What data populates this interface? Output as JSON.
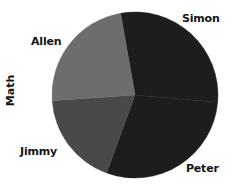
{
  "chart_data": {
    "type": "pie",
    "title": "Math",
    "xlabel": "",
    "ylabel": "",
    "legend_position": "none",
    "grid": false,
    "labels": [
      "Simon",
      "Peter",
      "Jimmy",
      "Allen"
    ],
    "categories": [
      "Simon",
      "Peter",
      "Jimmy",
      "Allen"
    ],
    "values": [
      29,
      33,
      18,
      20
    ],
    "units": "percent",
    "start_angle_deg": -10,
    "direction": "clockwise",
    "series": [
      {
        "name": "Math",
        "values": [
          29,
          33,
          18,
          20
        ]
      }
    ],
    "slices": [
      {
        "label": "Simon",
        "value": 29,
        "color": "#1d1d1d",
        "start_deg": -10,
        "end_deg": 95,
        "label_position": "top-right"
      },
      {
        "label": "Peter",
        "value": 33,
        "color": "#1d1d1d",
        "start_deg": 95,
        "end_deg": 200,
        "label_position": "bottom-right"
      },
      {
        "label": "Jimmy",
        "value": 18,
        "color": "#494949",
        "start_deg": 200,
        "end_deg": 266,
        "label_position": "bottom-left"
      },
      {
        "label": "Allen",
        "value": 20,
        "color": "#6d6d6d",
        "start_deg": 266,
        "end_deg": 350,
        "label_position": "top-left"
      }
    ],
    "geometry": {
      "center_x": 135,
      "center_y": 95,
      "radius": 83
    },
    "colors": {
      "background": "#ffffff",
      "text": "#141414",
      "simon": "#1d1d1d",
      "peter": "#1d1d1d",
      "jimmy": "#494949",
      "allen": "#6d6d6d"
    }
  },
  "labels": {
    "simon": "Simon",
    "peter": "Peter",
    "jimmy": "Jimmy",
    "allen": "Allen",
    "axis_title": "Math"
  }
}
